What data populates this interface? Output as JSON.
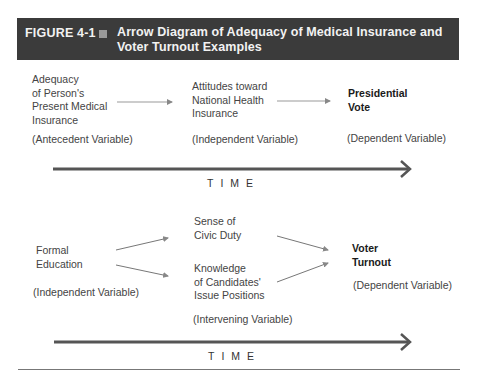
{
  "header": {
    "figure_label": "FIGURE 4-1",
    "title": "Arrow Diagram of Adequacy of Medical Insurance and Voter Turnout Examples",
    "bg_color": "#3b3b3b"
  },
  "diagram1": {
    "antecedent": {
      "text": [
        "Adequacy",
        "of Person's",
        "Present Medical",
        "Insurance"
      ],
      "role": "(Antecedent Variable)"
    },
    "independent": {
      "text": [
        "Attitudes toward",
        "National Health",
        "Insurance"
      ],
      "role": "(Independent Variable)"
    },
    "dependent": {
      "text": [
        "Presidential",
        "Vote"
      ],
      "role": "(Dependent Variable)"
    },
    "time_label": "TIME"
  },
  "diagram2": {
    "independent": {
      "text": [
        "Formal",
        "Education"
      ],
      "role": "(Independent Variable)"
    },
    "intervening_1": {
      "text": [
        "Sense of",
        "Civic Duty"
      ]
    },
    "intervening_2": {
      "text": [
        "Knowledge",
        "of Candidates'",
        "Issue Positions"
      ]
    },
    "intervening_role": "(Intervening Variable)",
    "dependent": {
      "text": [
        "Voter",
        "Turnout"
      ],
      "role": "(Dependent Variable)"
    },
    "time_label": "TIME"
  }
}
